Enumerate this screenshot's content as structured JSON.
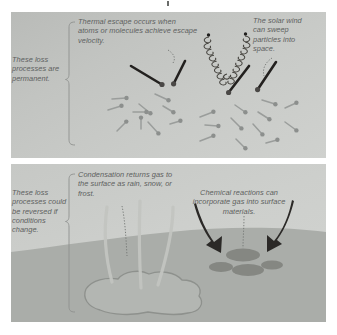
{
  "figure": {
    "background_color": "#ffffff",
    "top_panel_color": "#c6c8c5",
    "bottom_panel_color": "#cdcfcc",
    "ground_color": "#aaada9",
    "lake_color": "#b3b6b2",
    "caption_color": "#5d5f5e"
  },
  "top_panel": {
    "bracket_label": "These loss processes are permanent.",
    "annotations": [
      {
        "name": "thermal-escape",
        "text": "Thermal escape occurs when atoms or molecules achieve escape velocity."
      },
      {
        "name": "solar-wind",
        "text": "The solar wind can sweep particles into space."
      }
    ]
  },
  "bottom_panel": {
    "bracket_label": "These loss processes could be reversed if conditions change.",
    "annotations": [
      {
        "name": "condensation",
        "text": "Condensation returns gas to the surface as rain, snow, or frost."
      },
      {
        "name": "chemical-reactions",
        "text": "Chemical reactions can incorporate gas into surface materials."
      }
    ]
  }
}
